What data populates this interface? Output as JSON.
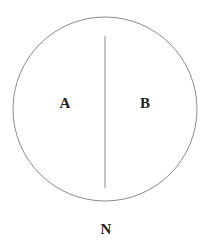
{
  "diagram": {
    "circle": {
      "cx": 105,
      "cy": 109,
      "r": 92,
      "stroke": "#8a8a8a"
    },
    "divider": {
      "x": 105,
      "y1": 36,
      "y2": 188,
      "stroke": "#8a8a8a"
    },
    "labels": {
      "left_region": "A",
      "right_region": "B",
      "bottom": "N"
    }
  }
}
